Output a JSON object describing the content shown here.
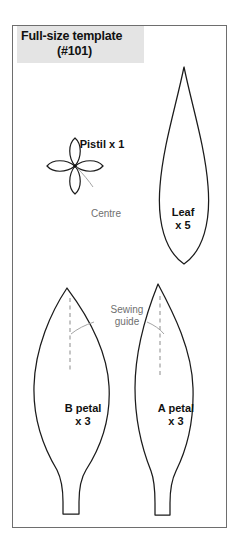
{
  "document": {
    "type": "sewing-pattern-template-sheet",
    "background_color": "#ffffff",
    "frame_border_color": "#6e6e6e"
  },
  "title": {
    "line1": "Full-size template",
    "line2": "(#101)",
    "highlight_color": "#e4e4e4",
    "text_color": "#111111"
  },
  "pieces": {
    "pistil": {
      "label": "Pistil x 1",
      "name": "Pistil",
      "quantity": "x 1",
      "shape": "four-petal-flower",
      "annotation": "Centre"
    },
    "leaf": {
      "label_line1": "Leaf",
      "label_line2": "x 5",
      "name": "Leaf",
      "quantity": "x 5",
      "shape": "teardrop"
    },
    "b_petal": {
      "label_line1": "B petal",
      "label_line2": "x 3",
      "name": "B petal",
      "quantity": "x 3",
      "shape": "wide-petal-with-stem"
    },
    "a_petal": {
      "label_line1": "A petal",
      "label_line2": "x 3",
      "name": "A petal",
      "quantity": "x 3",
      "shape": "narrow-petal-with-stem"
    }
  },
  "annotations": {
    "sewing_guide_line1": "Sewing",
    "sewing_guide_line2": "guide",
    "centre": "Centre",
    "guide_color": "#6f6f6f",
    "dashed_line_color": "#8b8b8b"
  }
}
